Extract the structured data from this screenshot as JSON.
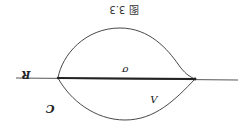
{
  "figure": {
    "caption": "图 3.3",
    "rotation_deg": 180,
    "labels": {
      "axis": "R",
      "segment": "σ",
      "lower_arc": "Λ",
      "contour": "C"
    },
    "colors": {
      "stroke": "#333333",
      "background": "#ffffff"
    }
  }
}
